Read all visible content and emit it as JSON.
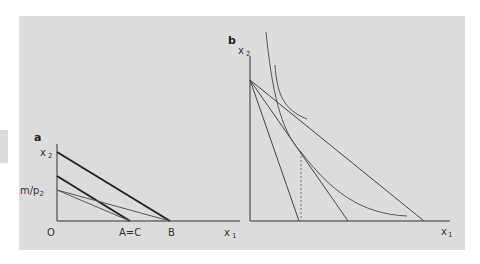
{
  "figure": {
    "background_color": "#dcdcdc",
    "line_color": "#333333",
    "thin_line_color": "#555555"
  },
  "panel_a": {
    "label": "a",
    "y_axis_label": "x",
    "y_axis_sub": "2",
    "x_axis_label": "x",
    "x_axis_sub": "1",
    "origin_label": "O",
    "intercept_label": "m/p",
    "intercept_sub": "2",
    "point_ac_label": "A=C",
    "point_b_label": "B"
  },
  "panel_b": {
    "label": "b",
    "y_axis_label": "x",
    "y_axis_sub": "2",
    "x_axis_label": "x",
    "x_axis_sub": "1"
  }
}
